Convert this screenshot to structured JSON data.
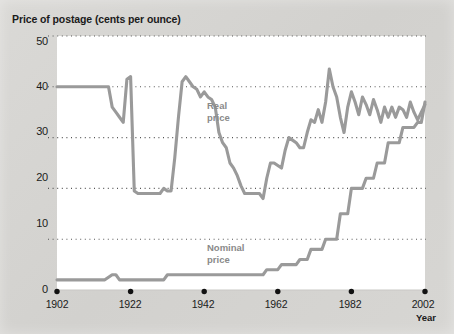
{
  "chart_data": {
    "type": "line",
    "title": "Price of postage (cents per ounce)",
    "xlabel": "Year",
    "ylabel": "Price of postage (cents per ounce)",
    "xlim": [
      1902,
      2002
    ],
    "ylim": [
      0,
      50
    ],
    "yticks": [
      0,
      10,
      20,
      30,
      40,
      50
    ],
    "xticks": [
      1902,
      1922,
      1942,
      1962,
      1982,
      2002
    ],
    "grid": "horizontal-dotted",
    "legend": "inline-labels",
    "line_color": "#9a9a9a",
    "grid_color": "#555555",
    "plot_bg": "#ffffff",
    "figure_bg": "#d6d5d2",
    "series": [
      {
        "name": "Real price",
        "label_lines": [
          "Real",
          "price"
        ],
        "x": [
          1902,
          1906,
          1910,
          1914,
          1916,
          1917,
          1918,
          1919,
          1920,
          1921,
          1922,
          1923,
          1924,
          1925,
          1926,
          1927,
          1928,
          1929,
          1930,
          1931,
          1932,
          1933,
          1934,
          1935,
          1936,
          1937,
          1938,
          1939,
          1940,
          1941,
          1942,
          1943,
          1944,
          1945,
          1946,
          1947,
          1948,
          1949,
          1950,
          1951,
          1952,
          1953,
          1954,
          1955,
          1956,
          1957,
          1958,
          1959,
          1960,
          1961,
          1962,
          1963,
          1964,
          1965,
          1966,
          1967,
          1968,
          1969,
          1970,
          1971,
          1972,
          1973,
          1974,
          1975,
          1976,
          1977,
          1978,
          1979,
          1980,
          1981,
          1982,
          1983,
          1984,
          1985,
          1986,
          1987,
          1988,
          1989,
          1990,
          1991,
          1992,
          1993,
          1994,
          1995,
          1996,
          1997,
          1998,
          1999,
          2000,
          2001,
          2002
        ],
        "y": [
          40,
          40,
          40,
          40,
          40,
          36,
          35,
          34,
          33,
          41.5,
          42,
          19.5,
          19,
          19,
          19,
          19,
          19,
          19,
          19,
          20,
          19.5,
          19.5,
          26,
          34,
          41,
          42,
          41,
          40,
          39.5,
          38,
          39,
          38,
          37.5,
          36,
          31,
          29,
          28,
          25,
          24,
          22.5,
          20.5,
          19,
          19,
          19,
          19,
          19,
          18,
          22,
          25,
          25,
          24.5,
          24,
          27.5,
          30,
          29.5,
          29,
          28,
          28,
          31,
          33.5,
          33,
          35.5,
          33,
          37,
          43.5,
          40,
          38,
          34,
          31,
          36,
          39,
          37,
          34.5,
          38,
          36.5,
          34.5,
          37.5,
          35.5,
          33,
          36,
          34,
          36,
          34,
          36,
          35.5,
          34,
          37,
          35,
          33.5,
          35,
          36.5
        ]
      },
      {
        "name": "Nominal price",
        "label_lines": [
          "Nominal",
          "price"
        ],
        "x": [
          1902,
          1915,
          1917,
          1918,
          1919,
          1920,
          1931,
          1932,
          1958,
          1959,
          1962,
          1963,
          1967,
          1968,
          1970,
          1971,
          1974,
          1975,
          1978,
          1979,
          1981,
          1982,
          1985,
          1986,
          1988,
          1989,
          1991,
          1992,
          1995,
          1996,
          1999,
          2000,
          2001,
          2002
        ],
        "y": [
          2,
          2,
          3,
          3,
          2,
          2,
          2,
          3,
          3,
          4,
          4,
          5,
          5,
          6,
          6,
          8,
          8,
          10,
          10,
          15,
          15,
          20,
          20,
          22,
          22,
          25,
          25,
          29,
          29,
          32,
          32,
          33,
          33,
          37
        ]
      }
    ]
  },
  "axis_labels": {
    "y": [
      "50",
      "40",
      "30",
      "20",
      "10",
      "0"
    ],
    "x": [
      "1902",
      "1922",
      "1942",
      "1962",
      "1982",
      "2002"
    ]
  },
  "header": {
    "title": "Price of postage (cents per ounce)"
  },
  "footer": {
    "year_label": "Year"
  },
  "labels": {
    "real_line1": "Real",
    "real_line2": "price",
    "nominal_line1": "Nominal",
    "nominal_line2": "price"
  }
}
